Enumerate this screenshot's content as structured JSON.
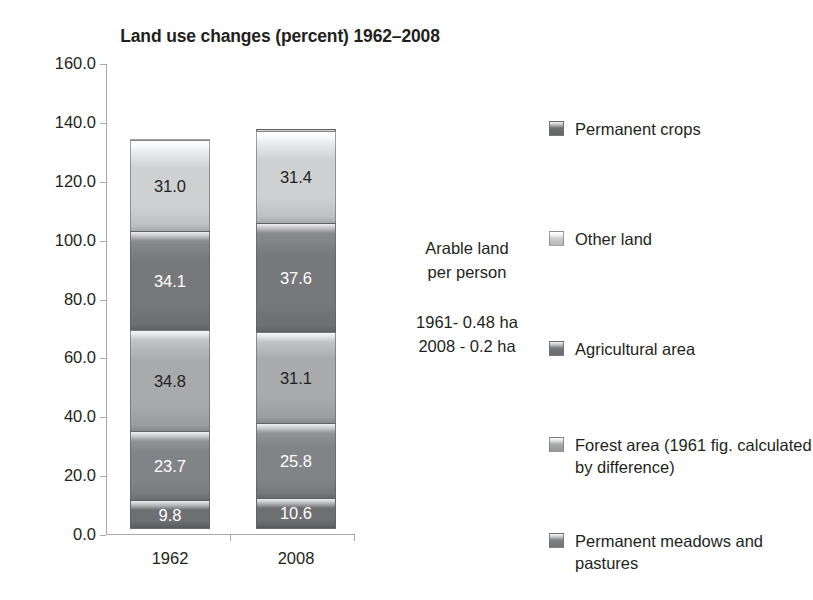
{
  "chart_data": {
    "type": "bar",
    "title": "Land use changes (percent) 1962–2008",
    "xlabel": "",
    "ylabel": "",
    "ylim": [
      0,
      160
    ],
    "ytick_step": 20,
    "grid": false,
    "stacked": true,
    "legend_position": "right",
    "categories": [
      "1962",
      "2008"
    ],
    "ytick_labels": [
      "160.0",
      "140.0",
      "120.0",
      "100.0",
      "80.0",
      "60.0",
      "40.0",
      "20.0",
      "0.0"
    ],
    "series": [
      {
        "name": "Permanent crops",
        "values": [
          0.7,
          1.1
        ],
        "color": "#6f7072",
        "label_color": "dark",
        "label_position": "above"
      },
      {
        "name": "Other land",
        "values": [
          31.0,
          31.4
        ],
        "color": "#cfd0d2",
        "label_color": "dark",
        "label_position": "inside"
      },
      {
        "name": "Agricultural area",
        "values": [
          34.1,
          37.6
        ],
        "color": "#77787a",
        "label_color": "light",
        "label_position": "inside"
      },
      {
        "name": "Forest area (1961 fig. calculated by difference)",
        "values": [
          34.8,
          31.1
        ],
        "color": "#a9aaac",
        "label_color": "dark",
        "label_position": "inside"
      },
      {
        "name": "Permanent meadows and pastures",
        "values": [
          23.7,
          25.8
        ],
        "color": "#828386",
        "label_color": "light",
        "label_position": "inside"
      },
      {
        "name": "Arable land",
        "values": [
          9.8,
          10.6
        ],
        "color": "#6e6f71",
        "label_color": "light",
        "label_position": "inside"
      }
    ],
    "totals": [
      134.1,
      137.6
    ],
    "value_labels": {
      "bar_1962": [
        "0.7",
        "31.0",
        "34.1",
        "34.8",
        "23.7",
        "9.8"
      ],
      "bar_2008": [
        "1.1",
        "31.4",
        "37.6",
        "31.1",
        "25.8",
        "10.6"
      ]
    },
    "annotations": {
      "heading_line1": "Arable land",
      "heading_line2": "per person",
      "stat_line1": "1961- 0.48 ha",
      "stat_line2": "2008 - 0.2 ha"
    }
  },
  "legend": {
    "items": [
      {
        "label": "Permanent crops",
        "color": "#6f7072",
        "top": 0
      },
      {
        "label": "Other land",
        "color": "#cfd0d2",
        "top": 110
      },
      {
        "label": "Agricultural area",
        "color": "#77787a",
        "top": 220
      },
      {
        "label": "Forest area (1961 fig. calculated by difference)",
        "color": "#a9aaac",
        "top": 316
      },
      {
        "label": "Permanent meadows and pastures",
        "color": "#828386",
        "top": 412
      },
      {
        "label": "Arable land",
        "color": "#6e6f71",
        "top": 508
      }
    ]
  }
}
